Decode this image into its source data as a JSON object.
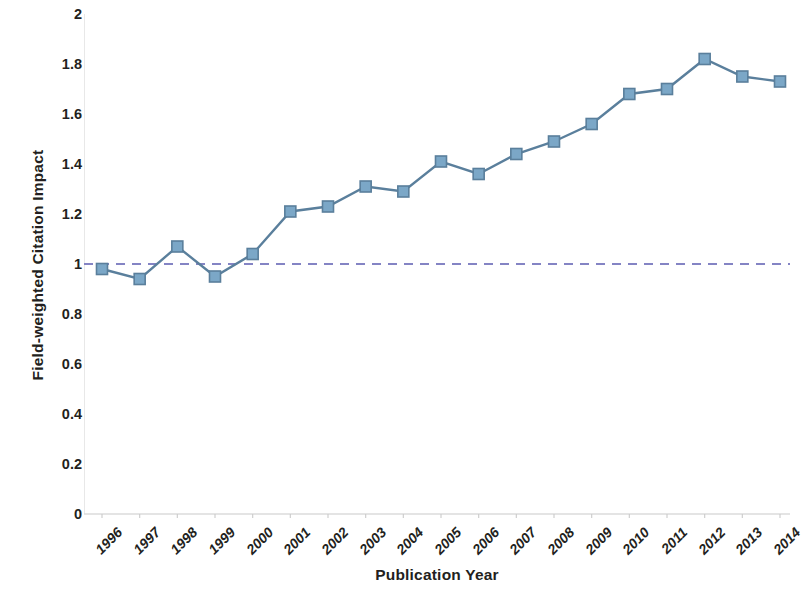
{
  "chart_data": {
    "type": "line",
    "title": "",
    "xlabel": "Publication Year",
    "ylabel": "Field-weighted Citation Impact",
    "categories": [
      "1996",
      "1997",
      "1998",
      "1999",
      "2000",
      "2001",
      "2002",
      "2003",
      "2004",
      "2005",
      "2006",
      "2007",
      "2008",
      "2009",
      "2010",
      "2011",
      "2012",
      "2013",
      "2014"
    ],
    "values": [
      0.98,
      0.94,
      1.07,
      0.95,
      1.04,
      1.21,
      1.23,
      1.31,
      1.29,
      1.41,
      1.36,
      1.44,
      1.49,
      1.56,
      1.68,
      1.7,
      1.82,
      1.75,
      1.73
    ],
    "series": [
      {
        "name": "Field-weighted Citation Impact",
        "values": [
          0.98,
          0.94,
          1.07,
          0.95,
          1.04,
          1.21,
          1.23,
          1.31,
          1.29,
          1.41,
          1.36,
          1.44,
          1.49,
          1.56,
          1.68,
          1.7,
          1.82,
          1.75,
          1.73
        ],
        "color": "#7ba7c7",
        "line_color": "#5a7f9c",
        "marker": "square"
      }
    ],
    "reference_line": {
      "name": "world-average",
      "value": 1.0,
      "style": "dashed",
      "color": "#8484c4"
    },
    "ylim": [
      0,
      2
    ],
    "yticks": [
      "0",
      "0.2",
      "0.4",
      "0.6",
      "0.8",
      "1",
      "1.2",
      "1.4",
      "1.6",
      "1.8",
      "2"
    ],
    "ytick_values": [
      0,
      0.2,
      0.4,
      0.6,
      0.8,
      1,
      1.2,
      1.4,
      1.6,
      1.8,
      2
    ],
    "xtick_rotation": -45,
    "grid": false,
    "legend": "none",
    "axis_color": "#bfbfbf"
  }
}
